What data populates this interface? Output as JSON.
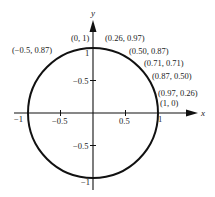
{
  "diagram": {
    "colors": {
      "stroke": "#111111",
      "text": "#222222",
      "background": "#ffffff"
    },
    "axes": {
      "x_label": "x",
      "y_label": "y",
      "x_ticks": [
        {
          "value": -1,
          "label": "−1"
        },
        {
          "value": -0.5,
          "label": "−0.5"
        },
        {
          "value": 0.5,
          "label": "0.5"
        },
        {
          "value": 1,
          "label": "1"
        }
      ],
      "y_ticks": [
        {
          "value": 1,
          "label": "1"
        },
        {
          "value": 0.5,
          "label": "−0.5"
        },
        {
          "value": -0.5,
          "label": "−0.5"
        },
        {
          "value": -1,
          "label": "−1"
        }
      ]
    },
    "circle": {
      "center": [
        0,
        0
      ],
      "radius": 1
    },
    "points": [
      {
        "label": "(−0.5, 0.87)",
        "x": -0.5,
        "y": 0.87
      },
      {
        "label": "(0, 1)",
        "x": 0,
        "y": 1
      },
      {
        "label": "(0.26, 0.97)",
        "x": 0.26,
        "y": 0.97
      },
      {
        "label": "(0.50, 0.87)",
        "x": 0.5,
        "y": 0.87
      },
      {
        "label": "(0.71, 0.71)",
        "x": 0.71,
        "y": 0.71
      },
      {
        "label": "(0.87, 0.50)",
        "x": 0.87,
        "y": 0.5
      },
      {
        "label": "(0.97, 0.26)",
        "x": 0.97,
        "y": 0.26
      },
      {
        "label": "(1, 0)",
        "x": 1,
        "y": 0
      }
    ]
  }
}
